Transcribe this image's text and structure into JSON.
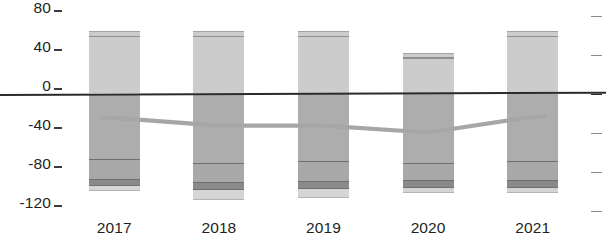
{
  "chart_data": {
    "type": "bar",
    "title": "",
    "subtitle": "",
    "xlabel": "",
    "ylabel": "",
    "categories": [
      "2017",
      "2018",
      "2019",
      "2020",
      "2021"
    ],
    "ylim": [
      -120,
      80
    ],
    "yticks": [
      80,
      40,
      0,
      -40,
      -80,
      -120
    ],
    "ytick_labels": [
      "80",
      "40",
      "0",
      "-40",
      "-80",
      "-120"
    ],
    "grid": false,
    "legend": null,
    "legend_position": "none",
    "zero_line": 0,
    "series": [
      {
        "name": "positive",
        "stack": "above-zero",
        "values": [
          64,
          64,
          64,
          42,
          64
        ]
      },
      {
        "name": "positive-cap",
        "stack": "above-zero-top",
        "values": [
          58,
          58,
          58,
          36,
          58
        ]
      },
      {
        "name": "negative-upper",
        "stack": "below-zero",
        "values": [
          -68,
          -72,
          -70,
          -72,
          -70
        ]
      },
      {
        "name": "negative-mid",
        "stack": "below-zero",
        "values": [
          -21,
          -20,
          -21,
          -18,
          -20
        ]
      },
      {
        "name": "negative-dark",
        "stack": "below-zero",
        "values": [
          -6,
          -7,
          -7,
          -7,
          -7
        ]
      },
      {
        "name": "negative-foot",
        "stack": "below-zero",
        "values": [
          -5,
          -10,
          -9,
          -5,
          -5
        ]
      }
    ],
    "bar_totals_positive": [
      64,
      64,
      64,
      42,
      64
    ],
    "bar_totals_negative": [
      -100,
      -109,
      -107,
      -102,
      -102
    ],
    "trend_line": {
      "name": "trend",
      "color": "#a6a6a6",
      "x": [
        "2017",
        "2018",
        "2019",
        "2020",
        "2021"
      ],
      "values": [
        -25,
        -33,
        -33,
        -40,
        -24
      ]
    }
  },
  "axis": {
    "y_ticks": [
      {
        "label": "80",
        "value": 80
      },
      {
        "label": "40",
        "value": 40
      },
      {
        "label": "0",
        "value": 0
      },
      {
        "label": "-40",
        "value": -40
      },
      {
        "label": "-80",
        "value": -80
      },
      {
        "label": "-120",
        "value": -120
      }
    ],
    "x_ticks": [
      "2017",
      "2018",
      "2019",
      "2020",
      "2021"
    ]
  },
  "colors": {
    "positive_body": "#cccccc",
    "positive_cap": "#8f8f8f",
    "negative_body": "#adadad",
    "negative_line": "#6f6f6f",
    "negative_mid": "#a8a8a8",
    "negative_dark": "#8a8a8a",
    "negative_foot": "#d5d5d5",
    "zero_line": "#2b2b2b",
    "trend_line": "#a6a6a6",
    "text": "#231f20",
    "tick_right": "#8b8b8b",
    "background": "#ffffff"
  }
}
